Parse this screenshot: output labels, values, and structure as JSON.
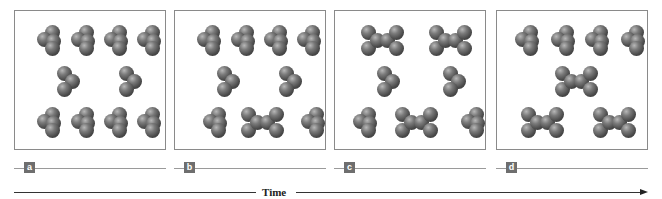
{
  "figure": {
    "colors": {
      "atom": "#4a4a4a",
      "frame_border": "#8a8a8a",
      "label_box": "#6e6e6e",
      "axis": "#333333"
    }
  },
  "frames": [
    {
      "label": "a",
      "molecules": [
        {
          "type": "tetra",
          "x": 22,
          "y": 14
        },
        {
          "type": "tetra",
          "x": 56,
          "y": 14
        },
        {
          "type": "tetra",
          "x": 89,
          "y": 14
        },
        {
          "type": "tetra",
          "x": 122,
          "y": 14
        },
        {
          "type": "tri",
          "x": 42,
          "y": 55
        },
        {
          "type": "tri",
          "x": 104,
          "y": 55
        },
        {
          "type": "tetra",
          "x": 22,
          "y": 96
        },
        {
          "type": "tetra",
          "x": 56,
          "y": 96
        },
        {
          "type": "tetra",
          "x": 89,
          "y": 96
        },
        {
          "type": "tetra",
          "x": 122,
          "y": 96
        }
      ]
    },
    {
      "label": "b",
      "molecules": [
        {
          "type": "tetra",
          "x": 22,
          "y": 14
        },
        {
          "type": "tetra",
          "x": 56,
          "y": 14
        },
        {
          "type": "tetra",
          "x": 89,
          "y": 14
        },
        {
          "type": "tetra",
          "x": 122,
          "y": 14
        },
        {
          "type": "tri",
          "x": 42,
          "y": 55
        },
        {
          "type": "tri",
          "x": 104,
          "y": 55
        },
        {
          "type": "tetra",
          "x": 28,
          "y": 96
        },
        {
          "type": "dimer",
          "x": 66,
          "y": 96
        },
        {
          "type": "tetra",
          "x": 126,
          "y": 96
        }
      ]
    },
    {
      "label": "c",
      "molecules": [
        {
          "type": "dimer",
          "x": 26,
          "y": 14
        },
        {
          "type": "dimer",
          "x": 94,
          "y": 14
        },
        {
          "type": "tri",
          "x": 42,
          "y": 55
        },
        {
          "type": "tri",
          "x": 108,
          "y": 55
        },
        {
          "type": "tetra",
          "x": 18,
          "y": 96
        },
        {
          "type": "dimer",
          "x": 60,
          "y": 96
        },
        {
          "type": "tetra",
          "x": 126,
          "y": 96
        }
      ]
    },
    {
      "label": "d",
      "molecules": [
        {
          "type": "tetra",
          "x": 18,
          "y": 14
        },
        {
          "type": "tetra",
          "x": 54,
          "y": 14
        },
        {
          "type": "tetra",
          "x": 88,
          "y": 14
        },
        {
          "type": "tetra",
          "x": 124,
          "y": 14
        },
        {
          "type": "dimer",
          "x": 58,
          "y": 55
        },
        {
          "type": "dimer",
          "x": 24,
          "y": 96
        },
        {
          "type": "dimer",
          "x": 96,
          "y": 96
        }
      ]
    }
  ],
  "time_axis": {
    "label": "Time"
  }
}
